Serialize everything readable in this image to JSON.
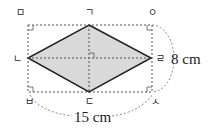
{
  "diagram": {
    "type": "rhombus-in-rectangle",
    "vertices": {
      "top": "ㄱ",
      "left": "ㄴ",
      "bottom": "ㄷ",
      "right": "ㄹ"
    },
    "rectangle_corners": {
      "top_left": "ㅁ",
      "top_right": "ㅇ",
      "bottom_left": "ㅂ",
      "bottom_right": "ㅅ"
    },
    "measurements": {
      "width": "15 cm",
      "height": "8 cm"
    },
    "colors": {
      "fill": "#d9d9d9",
      "stroke": "#222222",
      "dashed": "#555555"
    }
  }
}
